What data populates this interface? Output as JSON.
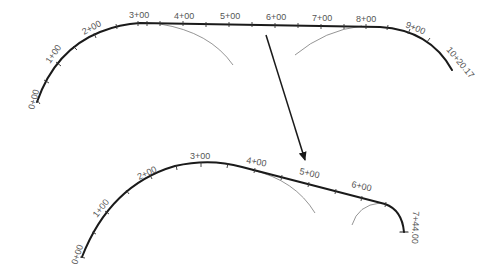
{
  "diagram": {
    "type": "road-alignment-stationing",
    "colors": {
      "alignment": "#1a1a1a",
      "construction_arc": "#7a7a7a",
      "label": "#555555",
      "background": "#ffffff"
    },
    "top_alignment": {
      "start_label": "0+00",
      "stations": [
        "1+00",
        "2+00",
        "3+00",
        "4+00",
        "5+00",
        "6+00",
        "7+00",
        "8+00",
        "9+00"
      ],
      "end_label": "10+20.17"
    },
    "arrow": {
      "direction": "down",
      "meaning": "transforms-to"
    },
    "bottom_alignment": {
      "start_label": "0+00",
      "stations": [
        "1+00",
        "2+00",
        "3+00",
        "4+00",
        "5+00",
        "6+00"
      ],
      "end_label": "7+44.00"
    }
  }
}
